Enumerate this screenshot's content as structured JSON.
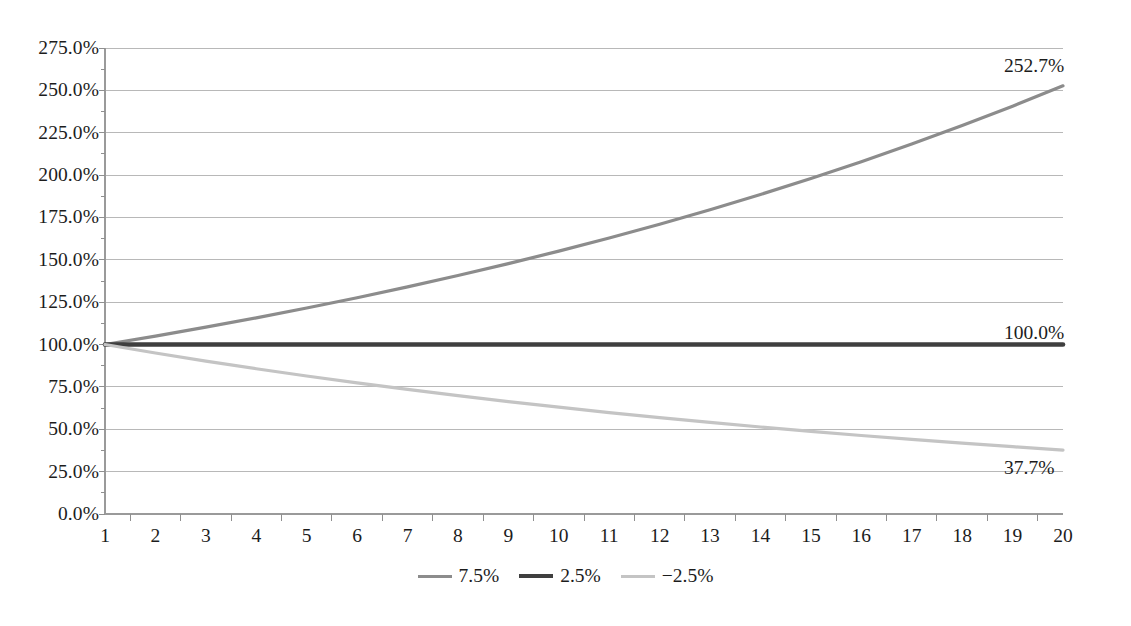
{
  "chart_data": {
    "type": "line",
    "title": "",
    "subtitle": "",
    "xlabel": "",
    "ylabel": "",
    "x": [
      1,
      2,
      3,
      4,
      5,
      6,
      7,
      8,
      9,
      10,
      11,
      12,
      13,
      14,
      15,
      16,
      17,
      18,
      19,
      20
    ],
    "xtick_labels": [
      "1",
      "2",
      "3",
      "4",
      "5",
      "6",
      "7",
      "8",
      "9",
      "10",
      "11",
      "12",
      "13",
      "14",
      "15",
      "16",
      "17",
      "18",
      "19",
      "20"
    ],
    "ylim": [
      0,
      275
    ],
    "ytick_values": [
      0,
      25,
      50,
      75,
      100,
      125,
      150,
      175,
      200,
      225,
      250,
      275
    ],
    "ytick_labels": [
      "0.0%",
      "25.0%",
      "50.0%",
      "75.0%",
      "100.0%",
      "125.0%",
      "150.0%",
      "175.0%",
      "200.0%",
      "225.0%",
      "250.0%",
      "275.0%"
    ],
    "grid": true,
    "grid_axis": "y",
    "legend_position": "bottom",
    "series": [
      {
        "name": "7.5%",
        "color": "#8c8c8c",
        "width": 3.2,
        "end_label": "252.7%",
        "values": [
          100.0,
          105.0,
          110.25,
          115.76,
          121.55,
          127.63,
          134.01,
          140.71,
          147.75,
          155.13,
          162.89,
          171.03,
          179.59,
          188.56,
          197.99,
          207.89,
          218.29,
          229.2,
          240.66,
          252.7
        ]
      },
      {
        "name": "2.5%",
        "color": "#3f3f3f",
        "width": 4.6,
        "end_label": "100.0%",
        "values": [
          100.0,
          100.0,
          100.0,
          100.0,
          100.0,
          100.0,
          100.0,
          100.0,
          100.0,
          100.0,
          100.0,
          100.0,
          100.0,
          100.0,
          100.0,
          100.0,
          100.0,
          100.0,
          100.0,
          100.0
        ]
      },
      {
        "name": "−2.5%",
        "color": "#c4c4c4",
        "width": 3.2,
        "end_label": "37.7%",
        "values": [
          100.0,
          95.0,
          90.25,
          85.74,
          81.45,
          77.38,
          73.51,
          69.83,
          66.34,
          63.02,
          59.87,
          56.88,
          54.04,
          51.33,
          48.77,
          46.33,
          44.01,
          41.81,
          39.72,
          37.7
        ]
      }
    ]
  },
  "axes": {
    "axis_color": "#9a9a9a",
    "grid_color": "#b8b8b8",
    "tick_color": "#8f8f8f"
  },
  "legend": {
    "items": [
      {
        "label": "7.5%",
        "color": "#8c8c8c",
        "width": 3.2
      },
      {
        "label": "2.5%",
        "color": "#3f3f3f",
        "width": 4.6
      },
      {
        "label": "−2.5%",
        "color": "#c4c4c4",
        "width": 3.2
      }
    ]
  }
}
